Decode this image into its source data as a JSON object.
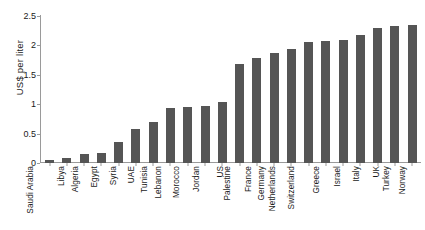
{
  "chart_data": {
    "type": "bar",
    "title": "",
    "xlabel": "",
    "ylabel": "US$ per liter",
    "ylim": [
      0,
      2.5
    ],
    "yticks": [
      "0",
      "0.5",
      "1",
      "1.5",
      "2",
      "2.5"
    ],
    "ytick_values": [
      0,
      0.5,
      1,
      1.5,
      2,
      2.5
    ],
    "grid": false,
    "legend": null,
    "bar_color": "#555555",
    "axis_color": "#9a9a9a",
    "background": "#ffffff",
    "categories": [
      "Saudi Arabia",
      "Libya",
      "Algeria",
      "Egypt",
      "Syria",
      "UAE",
      "Tunisia",
      "Lebanon",
      "Morocco",
      "Jordan",
      "US",
      "Palestine",
      "France",
      "Germany",
      "Netherlands",
      "Switzerland",
      "Greece",
      "Israel",
      "Italy",
      "UK",
      "Turkey",
      "Norway"
    ],
    "values": [
      0.05,
      0.09,
      0.16,
      0.17,
      0.36,
      0.58,
      0.7,
      0.94,
      0.95,
      0.96,
      1.03,
      1.67,
      1.78,
      1.87,
      1.94,
      2.05,
      2.07,
      2.08,
      2.17,
      2.29,
      2.32,
      2.34
    ]
  }
}
